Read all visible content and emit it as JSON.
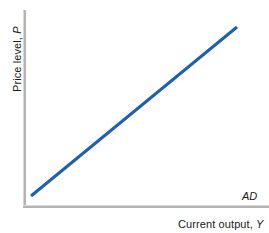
{
  "figure": {
    "background_color": "#ffffff",
    "axis_color": "#b4b4b4",
    "curve_color": "#1f5fad",
    "text_color": "#1a1a1a"
  },
  "axes": {
    "y": {
      "title_text": "Price level, ",
      "title_variable": "P"
    },
    "x": {
      "title_text": "Current output, ",
      "title_variable": "Y"
    }
  },
  "curve": {
    "label": "AD"
  },
  "chart_data": {
    "type": "line",
    "title": "",
    "subtitle": "",
    "xlabel": "Current output, Y",
    "ylabel": "Price level, P",
    "xlim": [
      0,
      100
    ],
    "ylim": [
      0,
      100
    ],
    "grid": false,
    "legend": "none",
    "axis_ticks": {
      "x": [],
      "y": []
    },
    "series": [
      {
        "name": "AD",
        "label": "AD",
        "color": "#1f5fad",
        "linewidth": 3,
        "x": [
          3,
          100
        ],
        "y": [
          91,
          5
        ],
        "points": [
          {
            "x": 3,
            "y": 91
          },
          {
            "x": 100,
            "y": 5
          }
        ]
      }
    ],
    "annotations": [
      {
        "text": "AD",
        "x": 103,
        "y": 3,
        "style": "italic",
        "describes": "aggregate demand curve endpoint label"
      }
    ]
  }
}
